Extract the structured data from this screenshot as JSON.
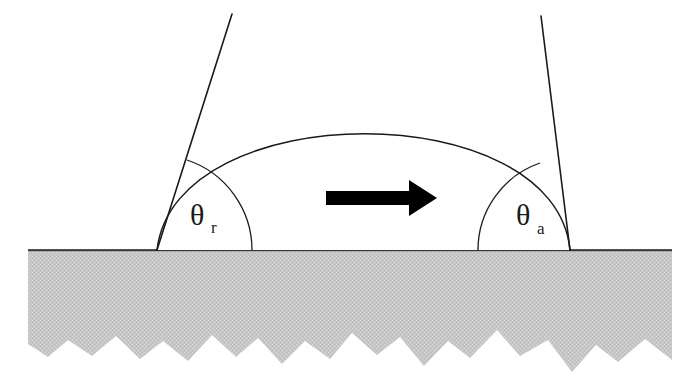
{
  "figure": {
    "background_color": "#ffffff"
  },
  "colors": {
    "substrate_fill": "#c6c6c6",
    "substrate_texture": "#d8d8d8",
    "line": "#1a1a1a",
    "arrow": "#000000",
    "droplet_fill": "#ffffff"
  },
  "labels": {
    "receding": {
      "symbol": "θ",
      "subscript": "r",
      "name": "receding-contact-angle",
      "x": 196,
      "y": 225
    },
    "advancing": {
      "symbol": "θ",
      "subscript": "a",
      "name": "advancing-contact-angle",
      "x": 522,
      "y": 225
    }
  },
  "geometry": {
    "baseline_y": 250,
    "substrate_left": 28,
    "substrate_right": 672,
    "substrate_bottom": 372,
    "droplet": {
      "left_contact_x": 157,
      "right_contact_x": 570,
      "apex_x": 370,
      "apex_y": 128
    },
    "tangents": {
      "left": {
        "x1": 157,
        "y1": 250,
        "x2": 232,
        "y2": 14
      },
      "right": {
        "x1": 570,
        "y1": 250,
        "x2": 541,
        "y2": 16
      }
    },
    "angle_arcs": {
      "left_radius": 95,
      "right_radius": 92
    },
    "arrow": {
      "x_start": 326,
      "x_end": 437,
      "y": 198,
      "shaft_half_height": 7,
      "head_length": 28,
      "head_half_height": 18
    }
  },
  "elements": {
    "substrate_name": "rough-solid-substrate",
    "droplet_name": "liquid-droplet",
    "baseline_name": "surface-baseline",
    "arrow_name": "motion-direction-arrow",
    "left_tangent_name": "receding-tangent-line",
    "right_tangent_name": "advancing-tangent-line",
    "left_arc_name": "receding-angle-arc",
    "right_arc_name": "advancing-angle-arc"
  }
}
